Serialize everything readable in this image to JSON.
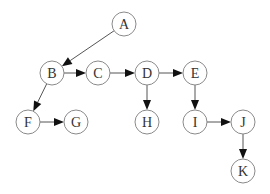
{
  "diagram": {
    "type": "directed-graph",
    "node_radius": 12,
    "colors": {
      "node_stroke": "#8a8a8a",
      "edge": "#555555",
      "arrow": "#111111",
      "label": "#333333",
      "background": "#ffffff"
    },
    "nodes": [
      {
        "id": "A",
        "label": "A",
        "x": 124,
        "y": 24
      },
      {
        "id": "B",
        "label": "B",
        "x": 52,
        "y": 73
      },
      {
        "id": "C",
        "label": "C",
        "x": 98,
        "y": 73
      },
      {
        "id": "D",
        "label": "D",
        "x": 147,
        "y": 73
      },
      {
        "id": "E",
        "label": "E",
        "x": 195,
        "y": 73
      },
      {
        "id": "F",
        "label": "F",
        "x": 28,
        "y": 122
      },
      {
        "id": "G",
        "label": "G",
        "x": 76,
        "y": 122
      },
      {
        "id": "H",
        "label": "H",
        "x": 147,
        "y": 122
      },
      {
        "id": "I",
        "label": "I",
        "x": 195,
        "y": 122
      },
      {
        "id": "J",
        "label": "J",
        "x": 243,
        "y": 122
      },
      {
        "id": "K",
        "label": "K",
        "x": 243,
        "y": 171
      }
    ],
    "edges": [
      {
        "from": "A",
        "to": "B"
      },
      {
        "from": "B",
        "to": "C"
      },
      {
        "from": "C",
        "to": "D"
      },
      {
        "from": "D",
        "to": "E"
      },
      {
        "from": "B",
        "to": "F"
      },
      {
        "from": "F",
        "to": "G"
      },
      {
        "from": "D",
        "to": "H"
      },
      {
        "from": "E",
        "to": "I"
      },
      {
        "from": "I",
        "to": "J"
      },
      {
        "from": "J",
        "to": "K"
      }
    ]
  }
}
